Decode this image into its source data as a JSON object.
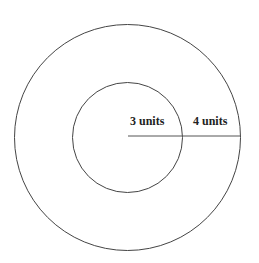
{
  "diagram": {
    "type": "concentric-circles",
    "center": [
      127.5,
      137
    ],
    "outer_radius_px": 113,
    "inner_radius_px": 55,
    "stroke_color": "#444444",
    "labels": {
      "inner": "3 units",
      "outer": "4 units"
    }
  }
}
